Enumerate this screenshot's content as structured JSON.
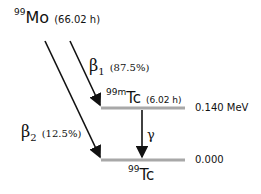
{
  "diagram": {
    "type": "nuclear-decay-scheme",
    "parent": {
      "mass": "99",
      "symbol": "Mo",
      "half_life": "(66.02 h)"
    },
    "metastable": {
      "mass": "99m",
      "symbol": "Tc",
      "half_life": "(6.02 h)",
      "energy": "0.140 MeV"
    },
    "ground": {
      "mass": "99",
      "symbol": "Tc",
      "energy": "0.000"
    },
    "transitions": [
      {
        "symbol": "β",
        "index": "1",
        "branch": "(87.5%)",
        "from": "99Mo",
        "to": "99mTc"
      },
      {
        "symbol": "β",
        "index": "2",
        "branch": "(12.5%)",
        "from": "99Mo",
        "to": "99Tc"
      },
      {
        "symbol": "γ",
        "from": "99mTc",
        "to": "99Tc"
      }
    ]
  }
}
